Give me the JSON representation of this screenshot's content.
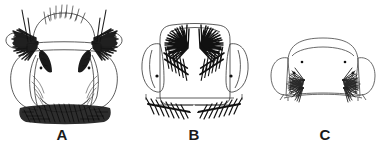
{
  "figure": {
    "type": "scientific-line-drawing-plate",
    "background_color": "#ffffff",
    "ink_color": "#1a1a1a",
    "panel_count": 3,
    "labels": [
      {
        "text": "A",
        "panel": "a"
      },
      {
        "text": "B",
        "panel": "b"
      },
      {
        "text": "C",
        "panel": "c"
      }
    ],
    "panels": [
      {
        "id": "a",
        "label": "A",
        "outline": "broad dome with flaring lateral lobes and rounded basal lobes",
        "features": [
          "apical row of fine erect bristles along dome arc",
          "two long curved lateral bristles",
          "paired dense dark lateral hair tufts",
          "paired dark inner wedge tufts",
          "paired setal sockets",
          "fine curved hair strokes on basal lobes",
          "dense dark basal fringe band"
        ]
      },
      {
        "id": "b",
        "label": "B",
        "outline": "sub-rectangular plate with rounded corners and ear-like lateral lobes",
        "features": [
          "paired radiating fan tufts at upper corners",
          "paired oblique feathered tufts below",
          "paired setal sockets",
          "split feathered basal fringe with median V-notch"
        ]
      },
      {
        "id": "c",
        "label": "C",
        "outline": "wide trapezoid with rounded lateral lobes and gently curved base",
        "features": [
          "paired upper setal sockets",
          "paired lower setal sockets",
          "paired small feathered lateral tufts",
          "plain curved basal margin with small flanking notches"
        ]
      }
    ]
  }
}
